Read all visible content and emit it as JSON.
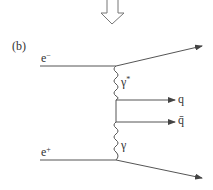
{
  "diagram": {
    "panel_label": "(b)",
    "type": "feynman-diagram",
    "transition_arrow": "down-arrow",
    "particles": {
      "electron": {
        "base": "e",
        "sup": "−"
      },
      "positron": {
        "base": "e",
        "sup": "+"
      },
      "virtual_photon": {
        "base": "γ",
        "sup": "*"
      },
      "photon": {
        "base": "γ",
        "sup": ""
      },
      "quark": "q",
      "antiquark": "q̄"
    },
    "colors": {
      "line": "#555555",
      "text": "#333333"
    }
  }
}
